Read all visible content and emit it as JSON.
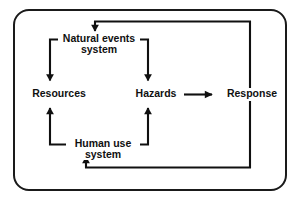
{
  "figure": {
    "type": "system-feedback-diagram",
    "border_color": "#1a1a1a",
    "line_color": "#101010",
    "background": "#ffffff"
  },
  "nodes": {
    "natural_events": {
      "label": "Natural events\nsystem",
      "line1": "Natural events",
      "line2": "system"
    },
    "resources": {
      "label": "Resources"
    },
    "hazards": {
      "label": "Hazards"
    },
    "response": {
      "label": "Response"
    },
    "human_use": {
      "label": "Human use\nsystem",
      "line1": "Human use",
      "line2": "system"
    }
  },
  "edges": [
    {
      "from": "natural_events",
      "to": "resources",
      "style": "elbow-down-left",
      "arrowhead": true
    },
    {
      "from": "natural_events",
      "to": "hazards",
      "style": "elbow-down-right",
      "arrowhead": true
    },
    {
      "from": "hazards",
      "to": "response",
      "style": "straight-horizontal",
      "arrowhead": true
    },
    {
      "from": "human_use",
      "to": "resources",
      "style": "elbow-up-left",
      "arrowhead": true
    },
    {
      "from": "human_use",
      "to": "hazards",
      "style": "elbow-up-right",
      "arrowhead": true
    },
    {
      "from": "response",
      "to": "natural_events",
      "style": "feedback-top",
      "arrowhead": true
    },
    {
      "from": "response",
      "to": "human_use",
      "style": "feedback-bottom",
      "arrowhead": true
    }
  ]
}
